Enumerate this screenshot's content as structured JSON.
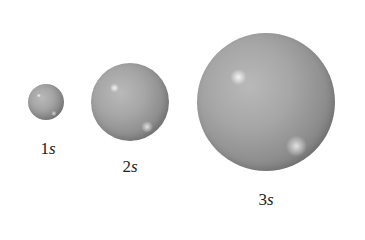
{
  "diagram": {
    "orbitals": [
      {
        "n": "1",
        "type": "s",
        "cx": 46,
        "cy": 102,
        "r": 18,
        "label_x": 48,
        "label_y": 139
      },
      {
        "n": "2",
        "type": "s",
        "cx": 130,
        "cy": 102,
        "r": 39,
        "label_x": 130,
        "label_y": 157
      },
      {
        "n": "3",
        "type": "s",
        "cx": 266,
        "cy": 102,
        "r": 69,
        "label_x": 266,
        "label_y": 190
      }
    ],
    "colors": {
      "sphere": "#a3a3a3",
      "background": "#ffffff",
      "text": "#222222"
    }
  }
}
